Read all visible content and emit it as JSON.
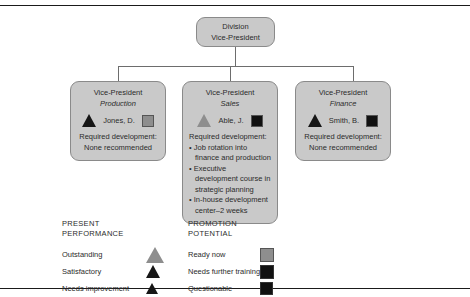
{
  "chart_type": "organizational-chart",
  "root": {
    "line1": "Division",
    "line2": "Vice-President"
  },
  "nodes": [
    {
      "title": "Vice-President",
      "subtitle": "Production",
      "person": "Jones, D.",
      "performance_symbol": "triangle-dark",
      "potential_symbol": "square-gray",
      "required_development_label": "Required development:",
      "required_development_text": "None recommended",
      "bullets": []
    },
    {
      "title": "Vice-President",
      "subtitle": "Sales",
      "person": "Able, J.",
      "performance_symbol": "triangle-gray",
      "potential_symbol": "square-dark",
      "required_development_label": "Required development:",
      "required_development_text": "",
      "bullets": [
        "Job rotation into finance and production",
        "Executive development course in strategic planning",
        "In-house development center–2 weeks"
      ]
    },
    {
      "title": "Vice-President",
      "subtitle": "Finance",
      "person": "Smith, B.",
      "performance_symbol": "triangle-dark",
      "potential_symbol": "square-dark",
      "required_development_label": "Required development:",
      "required_development_text": "None recommended",
      "bullets": []
    }
  ],
  "legends": {
    "present_performance": {
      "head_line1": "PRESENT",
      "head_line2": "PERFORMANCE",
      "rows": [
        {
          "label": "Outstanding",
          "symbol": "triangle-large-gray"
        },
        {
          "label": "Satisfactory",
          "symbol": "triangle-medium-dark"
        },
        {
          "label": "Needs improvement",
          "symbol": "triangle-small-dark"
        }
      ]
    },
    "promotion_potential": {
      "head_line1": "PROMOTION",
      "head_line2": "POTENTIAL",
      "rows": [
        {
          "label": "Ready now",
          "symbol": "square-large-gray"
        },
        {
          "label": "Needs further training",
          "symbol": "square-medium-dark"
        },
        {
          "label": "Questionable",
          "symbol": "square-small-dark"
        }
      ]
    }
  },
  "colors": {
    "box_fill": "#c9c9c9",
    "box_border": "#8a8a8a",
    "symbol_dark": "#161616",
    "symbol_gray": "#8e8e8e",
    "connector": "#6d6d6d",
    "rule": "#1a1a1a"
  }
}
